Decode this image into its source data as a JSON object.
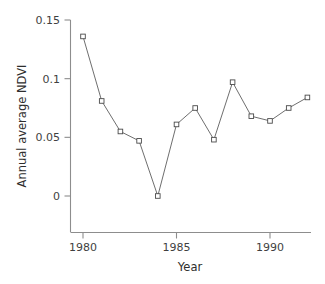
{
  "chart_data": {
    "type": "line",
    "title": "",
    "xlabel": "Year",
    "ylabel": "Annual average NDVI",
    "x": [
      1980,
      1981,
      1982,
      1983,
      1984,
      1985,
      1986,
      1987,
      1988,
      1989,
      1990,
      1991,
      1992
    ],
    "values": [
      0.136,
      0.081,
      0.055,
      0.047,
      0.0,
      0.061,
      0.075,
      0.048,
      0.097,
      0.068,
      0.064,
      0.075,
      0.084
    ],
    "series": [
      {
        "name": "Annual average NDVI",
        "values": [
          0.136,
          0.081,
          0.055,
          0.047,
          0.0,
          0.061,
          0.075,
          0.048,
          0.097,
          0.068,
          0.064,
          0.075,
          0.084
        ]
      }
    ],
    "xlim": [
      1979.3,
      1992.6
    ],
    "ylim": [
      -0.0185,
      0.15
    ],
    "xticks": [
      1980,
      1985,
      1990
    ],
    "xtick_labels": [
      "1980",
      "1985",
      "1990"
    ],
    "yticks": [
      0,
      0.05,
      0.1,
      0.15
    ],
    "ytick_labels": [
      "0",
      "0.05",
      "0.1",
      "0.15"
    ],
    "grid": false,
    "legend": null,
    "marker": "open-square",
    "line_color": "#5d5d5d",
    "marker_face_color": "#ffffff",
    "marker_edge_color": "#4a4a4a",
    "axis_color": "#8d8d8d",
    "background_color": "#ffffff"
  },
  "axes": {
    "x_axis_title": "Year",
    "y_axis_title": "Annual average NDVI"
  }
}
